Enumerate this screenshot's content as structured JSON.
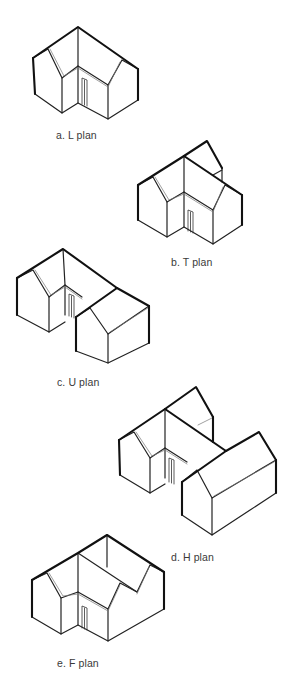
{
  "header": {
    "clipped_text": "(a) g... p... y... g...)"
  },
  "figures": [
    {
      "id": "L",
      "caption": "a. L plan",
      "caption_pos": [
        56,
        129
      ],
      "heavy": [
        [
          [
            33,
            58
          ],
          [
            78,
            27
          ],
          [
            138,
            69
          ]
        ],
        [
          [
            33,
            58
          ],
          [
            35,
            94
          ]
        ],
        [
          [
            138,
            69
          ],
          [
            138,
            100
          ]
        ]
      ],
      "med": [
        [
          [
            35,
            94
          ],
          [
            62,
            113
          ],
          [
            78,
            103
          ],
          [
            108,
            119
          ],
          [
            138,
            100
          ]
        ],
        [
          [
            33,
            58
          ],
          [
            48,
            49
          ],
          [
            62,
            78
          ],
          [
            78,
            66
          ],
          [
            108,
            85
          ],
          [
            122,
            60
          ],
          [
            138,
            69
          ]
        ],
        [
          [
            78,
            27
          ],
          [
            78,
            66
          ]
        ],
        [
          [
            62,
            78
          ],
          [
            62,
            113
          ]
        ],
        [
          [
            78,
            66
          ],
          [
            78,
            103
          ]
        ],
        [
          [
            108,
            85
          ],
          [
            108,
            119
          ]
        ]
      ],
      "fascia": [
        [
          [
            50,
            49
          ],
          [
            64,
            76
          ],
          [
            78,
            68
          ],
          [
            108,
            87
          ],
          [
            120,
            62
          ]
        ]
      ],
      "door": [
        [
          82,
          78
        ],
        [
          87,
          80
        ],
        [
          87,
          106
        ],
        [
          82,
          104
        ]
      ]
    },
    {
      "id": "T",
      "caption": "b. T plan",
      "caption_pos": [
        171,
        256
      ],
      "heavy": [
        [
          [
            138,
            185
          ],
          [
            184,
            156
          ],
          [
            242,
            195
          ]
        ],
        [
          [
            184,
            156
          ],
          [
            207,
            141
          ],
          [
            222,
            168
          ]
        ],
        [
          [
            138,
            185
          ],
          [
            138,
            220
          ]
        ],
        [
          [
            242,
            195
          ],
          [
            242,
            225
          ]
        ]
      ],
      "med": [
        [
          [
            138,
            220
          ],
          [
            167,
            237
          ],
          [
            184,
            227
          ],
          [
            213,
            244
          ],
          [
            242,
            225
          ]
        ],
        [
          [
            138,
            185
          ],
          [
            153,
            177
          ],
          [
            167,
            202
          ],
          [
            184,
            192
          ],
          [
            213,
            210
          ],
          [
            225,
            185
          ],
          [
            242,
            195
          ]
        ],
        [
          [
            184,
            156
          ],
          [
            184,
            192
          ]
        ],
        [
          [
            167,
            202
          ],
          [
            167,
            237
          ]
        ],
        [
          [
            184,
            192
          ],
          [
            184,
            227
          ]
        ],
        [
          [
            213,
            210
          ],
          [
            213,
            244
          ]
        ],
        [
          [
            222,
            168
          ],
          [
            222,
            182
          ]
        ],
        [
          [
            213,
            175
          ],
          [
            222,
            170
          ]
        ]
      ],
      "fascia": [
        [
          [
            155,
            177
          ],
          [
            169,
            200
          ],
          [
            184,
            194
          ],
          [
            213,
            212
          ],
          [
            223,
            187
          ]
        ]
      ],
      "door": [
        [
          188,
          210
        ],
        [
          193,
          212
        ],
        [
          193,
          233
        ],
        [
          188,
          231
        ]
      ]
    },
    {
      "id": "U",
      "caption": "c. U plan",
      "caption_pos": [
        57,
        376
      ],
      "heavy": [
        [
          [
            17,
            278
          ],
          [
            63,
            249
          ],
          [
            117,
            288
          ],
          [
            149,
            306
          ]
        ],
        [
          [
            117,
            288
          ],
          [
            76,
            317
          ]
        ],
        [
          [
            17,
            278
          ],
          [
            17,
            315
          ]
        ],
        [
          [
            149,
            306
          ],
          [
            149,
            343
          ]
        ],
        [
          [
            76,
            317
          ],
          [
            76,
            351
          ]
        ]
      ],
      "med": [
        [
          [
            17,
            315
          ],
          [
            49,
            332
          ],
          [
            49,
            297
          ]
        ],
        [
          [
            17,
            278
          ],
          [
            33,
            270
          ],
          [
            49,
            297
          ],
          [
            65,
            285
          ],
          [
            82,
            297
          ]
        ],
        [
          [
            63,
            249
          ],
          [
            65,
            285
          ]
        ],
        [
          [
            65,
            285
          ],
          [
            65,
            315
          ]
        ],
        [
          [
            76,
            351
          ],
          [
            108,
            363
          ],
          [
            149,
            343
          ]
        ],
        [
          [
            76,
            317
          ],
          [
            90,
            308
          ],
          [
            108,
            334
          ],
          [
            149,
            306
          ]
        ],
        [
          [
            108,
            334
          ],
          [
            108,
            363
          ]
        ],
        [
          [
            49,
            332
          ],
          [
            65,
            322
          ]
        ]
      ],
      "fascia": [
        [
          [
            35,
            270
          ],
          [
            51,
            295
          ],
          [
            65,
            287
          ],
          [
            82,
            299
          ]
        ],
        [
          [
            110,
            332
          ],
          [
            148,
            308
          ]
        ]
      ],
      "door": [
        [
          69,
          294
        ],
        [
          74,
          296
        ],
        [
          74,
          318
        ],
        [
          69,
          316
        ]
      ]
    },
    {
      "id": "H",
      "caption": "d. H plan",
      "caption_pos": [
        171,
        551
      ],
      "heavy": [
        [
          [
            119,
            440
          ],
          [
            165,
            409
          ],
          [
            226,
            451
          ],
          [
            259,
            432
          ],
          [
            276,
            460
          ]
        ],
        [
          [
            165,
            409
          ],
          [
            196,
            387
          ],
          [
            213,
            417
          ]
        ],
        [
          [
            226,
            451
          ],
          [
            182,
            482
          ]
        ],
        [
          [
            119,
            440
          ],
          [
            120,
            475
          ]
        ],
        [
          [
            213,
            417
          ],
          [
            213,
            442
          ]
        ],
        [
          [
            276,
            460
          ],
          [
            276,
            493
          ]
        ],
        [
          [
            182,
            482
          ],
          [
            182,
            515
          ]
        ]
      ],
      "med": [
        [
          [
            120,
            475
          ],
          [
            150,
            493
          ],
          [
            150,
            458
          ]
        ],
        [
          [
            119,
            440
          ],
          [
            134,
            432
          ],
          [
            150,
            458
          ],
          [
            165,
            448
          ],
          [
            187,
            462
          ]
        ],
        [
          [
            165,
            409
          ],
          [
            165,
            448
          ]
        ],
        [
          [
            165,
            448
          ],
          [
            165,
            478
          ]
        ],
        [
          [
            182,
            515
          ],
          [
            212,
            535
          ],
          [
            276,
            493
          ]
        ],
        [
          [
            182,
            482
          ],
          [
            197,
            470
          ],
          [
            212,
            498
          ],
          [
            276,
            460
          ]
        ],
        [
          [
            212,
            498
          ],
          [
            212,
            535
          ]
        ],
        [
          [
            150,
            493
          ],
          [
            165,
            484
          ]
        ]
      ],
      "fascia": [
        [
          [
            136,
            432
          ],
          [
            152,
            456
          ],
          [
            165,
            450
          ],
          [
            187,
            464
          ]
        ],
        [
          [
            198,
            425
          ],
          [
            212,
            418
          ]
        ],
        [
          [
            214,
            496
          ],
          [
            274,
            462
          ]
        ]
      ],
      "door": [
        [
          169,
          458
        ],
        [
          174,
          460
        ],
        [
          174,
          484
        ],
        [
          169,
          482
        ]
      ]
    },
    {
      "id": "F",
      "caption": "e. F plan",
      "caption_pos": [
        57,
        657
      ],
      "heavy": [
        [
          [
            32,
            580
          ],
          [
            78,
            553
          ],
          [
            107,
            535
          ],
          [
            164,
            572
          ]
        ],
        [
          [
            32,
            580
          ],
          [
            32,
            617
          ]
        ],
        [
          [
            164,
            572
          ],
          [
            164,
            609
          ]
        ]
      ],
      "med": [
        [
          [
            32,
            617
          ],
          [
            61,
            634
          ],
          [
            78,
            625
          ],
          [
            108,
            641
          ],
          [
            164,
            609
          ]
        ],
        [
          [
            32,
            580
          ],
          [
            47,
            573
          ],
          [
            61,
            598
          ],
          [
            78,
            592
          ],
          [
            108,
            609
          ],
          [
            120,
            583
          ],
          [
            137,
            592
          ],
          [
            150,
            565
          ],
          [
            164,
            572
          ]
        ],
        [
          [
            78,
            553
          ],
          [
            137,
            592
          ]
        ],
        [
          [
            107,
            535
          ],
          [
            107,
            567
          ]
        ],
        [
          [
            78,
            553
          ],
          [
            78,
            592
          ]
        ],
        [
          [
            61,
            598
          ],
          [
            61,
            634
          ]
        ],
        [
          [
            78,
            592
          ],
          [
            78,
            625
          ]
        ],
        [
          [
            108,
            609
          ],
          [
            108,
            641
          ]
        ]
      ],
      "fascia": [
        [
          [
            49,
            573
          ],
          [
            63,
            596
          ],
          [
            78,
            594
          ],
          [
            108,
            611
          ],
          [
            120,
            585
          ]
        ],
        [
          [
            137,
            594
          ],
          [
            149,
            567
          ]
        ]
      ],
      "door": [
        [
          82,
          606
        ],
        [
          87,
          608
        ],
        [
          87,
          630
        ],
        [
          82,
          628
        ]
      ]
    }
  ]
}
